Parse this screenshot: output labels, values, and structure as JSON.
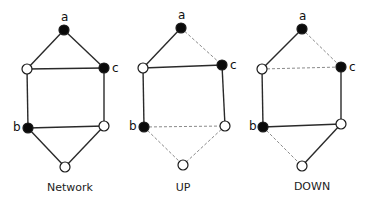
{
  "panels": [
    {
      "id": "network",
      "title": "Network",
      "title_pos": [
        70,
        191
      ],
      "nodes": [
        {
          "id": "a",
          "x": 64,
          "y": 30,
          "filled": true,
          "label": "a",
          "label_dx": -3,
          "label_dy": -9
        },
        {
          "id": "lu",
          "x": 27,
          "y": 69,
          "filled": false,
          "label": ""
        },
        {
          "id": "c",
          "x": 104,
          "y": 68,
          "filled": true,
          "label": "c",
          "label_dx": 8,
          "label_dy": 4
        },
        {
          "id": "b",
          "x": 28,
          "y": 128,
          "filled": true,
          "label": "b",
          "label_dx": -15,
          "label_dy": 3
        },
        {
          "id": "rl",
          "x": 104,
          "y": 126,
          "filled": false,
          "label": ""
        },
        {
          "id": "bt",
          "x": 65,
          "y": 167,
          "filled": false,
          "label": ""
        }
      ],
      "edges": [
        {
          "from": "a",
          "to": "lu",
          "style": "solid"
        },
        {
          "from": "a",
          "to": "c",
          "style": "solid"
        },
        {
          "from": "lu",
          "to": "c",
          "style": "solid"
        },
        {
          "from": "lu",
          "to": "b",
          "style": "solid"
        },
        {
          "from": "c",
          "to": "rl",
          "style": "solid"
        },
        {
          "from": "b",
          "to": "rl",
          "style": "solid"
        },
        {
          "from": "b",
          "to": "bt",
          "style": "solid"
        },
        {
          "from": "rl",
          "to": "bt",
          "style": "solid"
        }
      ]
    },
    {
      "id": "up",
      "title": "UP",
      "title_pos": [
        183,
        191
      ],
      "nodes": [
        {
          "id": "a",
          "x": 181,
          "y": 28,
          "filled": true,
          "label": "a",
          "label_dx": -3,
          "label_dy": -9
        },
        {
          "id": "lu",
          "x": 143,
          "y": 68,
          "filled": false,
          "label": ""
        },
        {
          "id": "c",
          "x": 222,
          "y": 65,
          "filled": true,
          "label": "c",
          "label_dx": 8,
          "label_dy": 4
        },
        {
          "id": "b",
          "x": 144,
          "y": 127,
          "filled": true,
          "label": "b",
          "label_dx": -15,
          "label_dy": 3
        },
        {
          "id": "rl",
          "x": 225,
          "y": 126,
          "filled": false,
          "label": ""
        },
        {
          "id": "bt",
          "x": 183,
          "y": 165,
          "filled": false,
          "label": ""
        }
      ],
      "edges": [
        {
          "from": "a",
          "to": "lu",
          "style": "solid"
        },
        {
          "from": "a",
          "to": "c",
          "style": "dashed"
        },
        {
          "from": "lu",
          "to": "c",
          "style": "solid"
        },
        {
          "from": "lu",
          "to": "b",
          "style": "solid"
        },
        {
          "from": "c",
          "to": "rl",
          "style": "solid"
        },
        {
          "from": "b",
          "to": "rl",
          "style": "dashed"
        },
        {
          "from": "b",
          "to": "bt",
          "style": "dashed"
        },
        {
          "from": "rl",
          "to": "bt",
          "style": "dashed"
        }
      ]
    },
    {
      "id": "down",
      "title": "DOWN",
      "title_pos": [
        312,
        190
      ],
      "nodes": [
        {
          "id": "a",
          "x": 302,
          "y": 29,
          "filled": true,
          "label": "a",
          "label_dx": -3,
          "label_dy": -9
        },
        {
          "id": "lu",
          "x": 262,
          "y": 69,
          "filled": false,
          "label": ""
        },
        {
          "id": "c",
          "x": 341,
          "y": 67,
          "filled": true,
          "label": "c",
          "label_dx": 8,
          "label_dy": 4
        },
        {
          "id": "b",
          "x": 263,
          "y": 127,
          "filled": true,
          "label": "b",
          "label_dx": -14,
          "label_dy": 3
        },
        {
          "id": "rl",
          "x": 341,
          "y": 124,
          "filled": false,
          "label": ""
        },
        {
          "id": "bt",
          "x": 302,
          "y": 166,
          "filled": false,
          "label": ""
        }
      ],
      "edges": [
        {
          "from": "a",
          "to": "lu",
          "style": "solid"
        },
        {
          "from": "a",
          "to": "c",
          "style": "dashed"
        },
        {
          "from": "lu",
          "to": "c",
          "style": "dashed"
        },
        {
          "from": "lu",
          "to": "b",
          "style": "solid"
        },
        {
          "from": "c",
          "to": "rl",
          "style": "solid"
        },
        {
          "from": "b",
          "to": "rl",
          "style": "solid"
        },
        {
          "from": "b",
          "to": "bt",
          "style": "dashed"
        },
        {
          "from": "rl",
          "to": "bt",
          "style": "solid"
        }
      ]
    }
  ],
  "node_radius": 5
}
